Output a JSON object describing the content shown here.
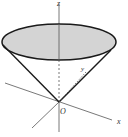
{
  "diagram": {
    "labels": {
      "z_axis": "z",
      "x_axis": "x",
      "origin": "O",
      "slant": "y"
    },
    "colors": {
      "fill": "#d4d4d4",
      "stroke": "#1a1a1a",
      "axis": "#444444"
    }
  }
}
